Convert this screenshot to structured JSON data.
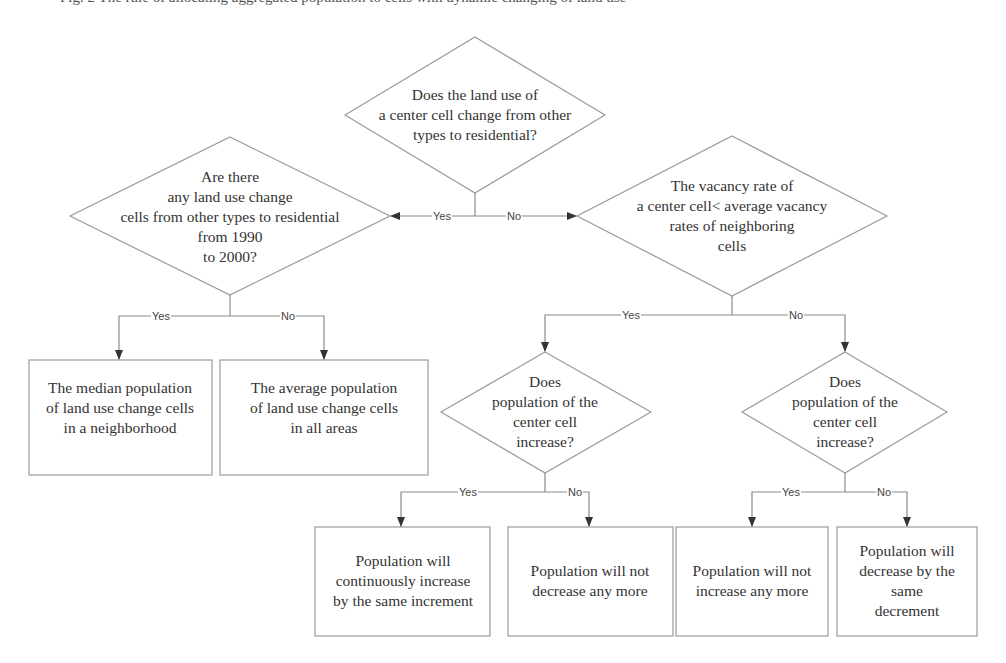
{
  "caption": "Fig. 2 The rule of allocating aggregated population to cells with dynamic changing of land use",
  "nodes": {
    "d_top": "Does the land use of\na center cell change from other\ntypes to residential?",
    "d_left": "Are there\nany land use change\ncells from other types to residential\nfrom 1990\nto 2000?",
    "d_right": "The vacancy rate of\na center cell< average vacancy\nrates of neighboring\ncells",
    "b_median": "The median population\nof land use change cells\nin a neighborhood",
    "b_average": "The average population\nof land use change cells\nin  all areas",
    "d_pop_left": "Does\npopulation of the\ncenter cell\nincrease?",
    "d_pop_right": "Does\npopulation of the\ncenter cell\nincrease?",
    "b_cont_inc": "Population will\ncontinuously increase\nby the same increment",
    "b_not_dec": "Population will not\ndecrease any more",
    "b_not_inc": "Population will not\nincrease any more",
    "b_dec": "Population will\ndecrease by the\nsame decrement"
  },
  "edges": {
    "top_yes": "Yes",
    "top_no": "No",
    "left_yes": "Yes",
    "left_no": "No",
    "right_yes": "Yes",
    "right_no": "No",
    "pl_yes": "Yes",
    "pl_no": "No",
    "pr_yes": "Yes",
    "pr_no": "No"
  }
}
